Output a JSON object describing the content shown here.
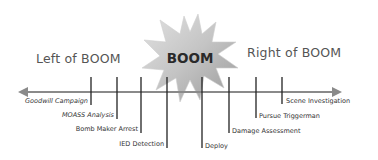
{
  "diagram": {
    "title_center": "BOOM",
    "left_label": "Left of BOOM",
    "right_label": "Right of BOOM",
    "axis": {
      "direction": "bidirectional",
      "color": "#888888"
    },
    "left_events": [
      {
        "label": "Goodwill Campaign",
        "x": 91,
        "bottom": 105
      },
      {
        "label": "MOASS Analysis",
        "x": 117,
        "bottom": 119
      },
      {
        "label": "Bomb Maker Arrest",
        "x": 141,
        "bottom": 133
      },
      {
        "label": "IED Detection",
        "x": 167,
        "bottom": 148
      }
    ],
    "right_events": [
      {
        "label": "Deploy",
        "x": 202,
        "bottom": 148
      },
      {
        "label": "Damage Assessment",
        "x": 229,
        "bottom": 133
      },
      {
        "label": "Pursue Triggerman",
        "x": 256,
        "bottom": 118
      },
      {
        "label": "Scene Investigation",
        "x": 282,
        "bottom": 104
      }
    ],
    "colors": {
      "starburst_fill": "#b9b9b9",
      "starburst_highlight": "#e0e0e0",
      "tick": "#222222",
      "text": "#555555"
    }
  }
}
